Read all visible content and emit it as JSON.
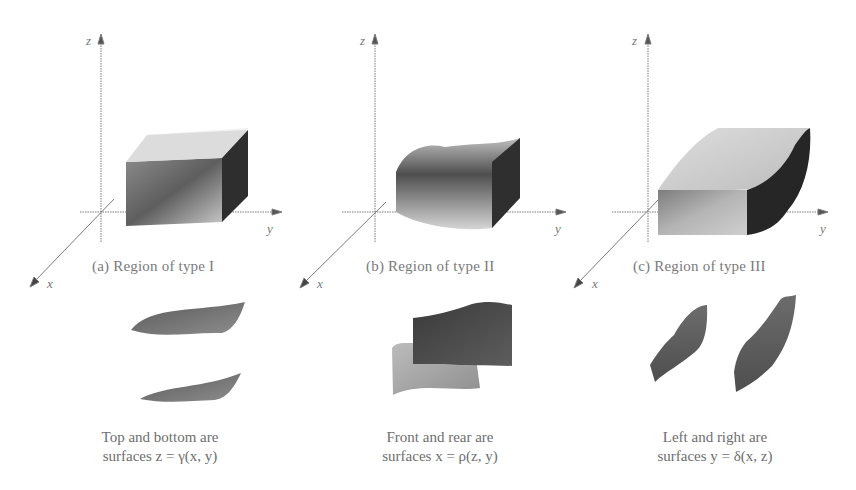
{
  "figure": {
    "panels": [
      {
        "id": "a",
        "caption": "(a)  Region of type I",
        "axes": {
          "z": "z",
          "y": "y",
          "x": "x"
        },
        "description_line1": "Top and bottom are",
        "description_line2": "surfaces z = γ(x, y)",
        "pieces": "top-and-bottom-surfaces"
      },
      {
        "id": "b",
        "caption": "(b)  Region of type II",
        "axes": {
          "z": "z",
          "y": "y",
          "x": "x"
        },
        "description_line1": "Front and rear are",
        "description_line2": "surfaces x = ρ(z, y)",
        "pieces": "front-and-rear-surfaces"
      },
      {
        "id": "c",
        "caption": "(c)  Region of type III",
        "axes": {
          "z": "z",
          "y": "y",
          "x": "x"
        },
        "description_line1": "Left and right are",
        "description_line2": "surfaces y = δ(x, z)",
        "pieces": "left-and-right-surfaces"
      }
    ]
  },
  "colors": {
    "axis": "#7a7a7a",
    "dark_face": "#2a2a2a",
    "mid_face": "#707070",
    "light_face": "#c8c8c8"
  }
}
